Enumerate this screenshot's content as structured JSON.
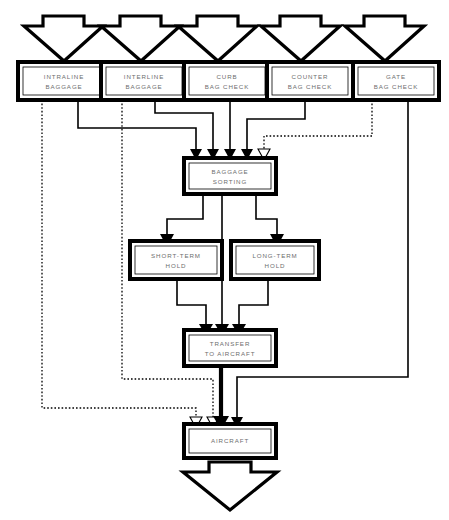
{
  "diagram": {
    "type": "flowchart",
    "colors": {
      "stroke": "#000000",
      "background": "#ffffff",
      "label_text": "#6e6e6e"
    },
    "legend": {
      "solid_line": "solid connector",
      "dotted_line": "dotted connector",
      "thick_line": "thick connector"
    },
    "inputs": [
      {
        "id": "in-intraline",
        "icon": "down-block-arrow"
      },
      {
        "id": "in-interline",
        "icon": "down-block-arrow"
      },
      {
        "id": "in-curb",
        "icon": "down-block-arrow"
      },
      {
        "id": "in-counter",
        "icon": "down-block-arrow"
      },
      {
        "id": "in-gate",
        "icon": "down-block-arrow"
      }
    ],
    "output": {
      "id": "out-aircraft",
      "icon": "down-block-arrow"
    },
    "nodes": [
      {
        "id": "intraline-baggage",
        "line1": "INTRALINE",
        "line2": "BAGGAGE"
      },
      {
        "id": "interline-baggage",
        "line1": "INTERLINE",
        "line2": "BAGGAGE"
      },
      {
        "id": "curb-bag-check",
        "line1": "CURB",
        "line2": "BAG CHECK"
      },
      {
        "id": "counter-bag-check",
        "line1": "COUNTER",
        "line2": "BAG CHECK"
      },
      {
        "id": "gate-bag-check",
        "line1": "GATE",
        "line2": "BAG CHECK"
      },
      {
        "id": "baggage-sorting",
        "line1": "BAGGAGE",
        "line2": "SORTING"
      },
      {
        "id": "short-term-hold",
        "line1": "SHORT-TERM",
        "line2": "HOLD"
      },
      {
        "id": "long-term-hold",
        "line1": "LONG-TERM",
        "line2": "HOLD"
      },
      {
        "id": "transfer-to-aircraft",
        "line1": "TRANSFER",
        "line2": "TO AIRCRAFT"
      },
      {
        "id": "aircraft",
        "line1": "AIRCRAFT",
        "line2": ""
      }
    ],
    "edges": [
      {
        "from": "intraline-baggage",
        "to": "aircraft",
        "style": "dotted"
      },
      {
        "from": "intraline-baggage",
        "to": "baggage-sorting",
        "style": "solid"
      },
      {
        "from": "interline-baggage",
        "to": "aircraft",
        "style": "dotted"
      },
      {
        "from": "interline-baggage",
        "to": "baggage-sorting",
        "style": "solid"
      },
      {
        "from": "curb-bag-check",
        "to": "baggage-sorting",
        "style": "solid"
      },
      {
        "from": "counter-bag-check",
        "to": "baggage-sorting",
        "style": "solid"
      },
      {
        "from": "gate-bag-check",
        "to": "baggage-sorting",
        "style": "dotted"
      },
      {
        "from": "gate-bag-check",
        "to": "aircraft",
        "style": "solid"
      },
      {
        "from": "baggage-sorting",
        "to": "short-term-hold",
        "style": "solid"
      },
      {
        "from": "baggage-sorting",
        "to": "long-term-hold",
        "style": "solid"
      },
      {
        "from": "baggage-sorting",
        "to": "transfer-to-aircraft",
        "style": "solid"
      },
      {
        "from": "short-term-hold",
        "to": "transfer-to-aircraft",
        "style": "solid"
      },
      {
        "from": "long-term-hold",
        "to": "transfer-to-aircraft",
        "style": "solid"
      },
      {
        "from": "transfer-to-aircraft",
        "to": "aircraft",
        "style": "thick"
      }
    ]
  }
}
